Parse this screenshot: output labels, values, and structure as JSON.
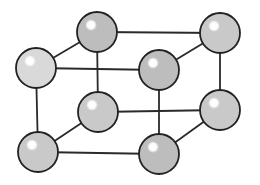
{
  "diagram": {
    "type": "crystal-lattice-unit-cell",
    "atom_radius": 20,
    "colors": {
      "background": "#ffffff",
      "edge": "#2a2a2a",
      "atom_outline": "#222222",
      "atom_fill_back": "#bdbdbd",
      "atom_fill_front": "#c9c9c9",
      "atom_fill_light": "#d9d9d9",
      "highlight": "#ffffff"
    },
    "atoms": [
      {
        "id": "back-top-left",
        "x": 97,
        "y": 32,
        "shade": "back"
      },
      {
        "id": "back-top-right",
        "x": 220,
        "y": 33,
        "shade": "front"
      },
      {
        "id": "back-bottom-left",
        "x": 98,
        "y": 112,
        "shade": "front"
      },
      {
        "id": "back-bottom-right",
        "x": 220,
        "y": 110,
        "shade": "front"
      },
      {
        "id": "front-top-left",
        "x": 36,
        "y": 68,
        "shade": "light"
      },
      {
        "id": "front-top-right",
        "x": 159,
        "y": 70,
        "shade": "back"
      },
      {
        "id": "front-bottom-left",
        "x": 38,
        "y": 152,
        "shade": "front"
      },
      {
        "id": "front-bottom-right",
        "x": 159,
        "y": 154,
        "shade": "back"
      }
    ],
    "edges": [
      [
        "front-top-left",
        "front-top-right"
      ],
      [
        "front-bottom-left",
        "front-bottom-right"
      ],
      [
        "front-top-left",
        "front-bottom-left"
      ],
      [
        "front-top-right",
        "front-bottom-right"
      ],
      [
        "back-top-left",
        "back-top-right"
      ],
      [
        "back-bottom-left",
        "back-bottom-right"
      ],
      [
        "back-top-left",
        "back-bottom-left"
      ],
      [
        "back-top-right",
        "back-bottom-right"
      ],
      [
        "front-top-left",
        "back-top-left"
      ],
      [
        "front-top-right",
        "back-top-right"
      ],
      [
        "front-bottom-left",
        "back-bottom-left"
      ],
      [
        "front-bottom-right",
        "back-bottom-right"
      ]
    ]
  }
}
